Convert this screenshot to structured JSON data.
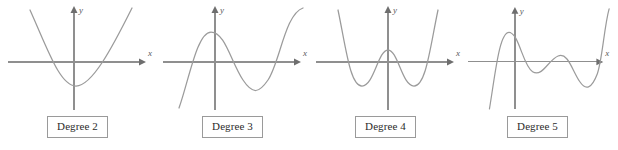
{
  "figure": {
    "background_color": "#ffffff",
    "axis_color": "#8f8f8f",
    "curve_color": "#9b9b9b",
    "label_border_color": "#9a9a9a",
    "label_text_color": "#2b2b2b"
  },
  "axis_labels": {
    "x": "x",
    "y": "y"
  },
  "panels": [
    {
      "id": "degree-2",
      "label": "Degree 2",
      "x_axis_label": "x",
      "y_axis_label": "y",
      "curve_path": "M 30 10 C 48 50, 60 86, 76 86 C 92 86, 112 48, 132 8",
      "y_axis": {
        "x": 74,
        "top": 9,
        "bottom": 110
      },
      "x_axis": {
        "y": 62,
        "left": 8,
        "right": 142
      }
    },
    {
      "id": "degree-3",
      "label": "Degree 3",
      "x_axis_label": "x",
      "y_axis_label": "y",
      "curve_path": "M 24 108 C 34 80, 42 32, 56 32 C 70 32, 76 62, 88 80 C 98 95, 104 93, 113 80 C 125 62, 130 14, 148 8",
      "y_axis": {
        "x": 60,
        "top": 9,
        "bottom": 110
      },
      "x_axis": {
        "y": 62,
        "left": 8,
        "right": 142
      }
    },
    {
      "id": "degree-4",
      "label": "Degree 4",
      "x_axis_label": "x",
      "y_axis_label": "y",
      "curve_path": "M 30 10 C 38 48, 42 86, 54 86 C 66 86, 70 50, 80 50 C 90 50, 94 86, 106 86 C 118 86, 122 48, 130 10",
      "y_axis": {
        "x": 80,
        "top": 9,
        "bottom": 110
      },
      "x_axis": {
        "y": 62,
        "left": 8,
        "right": 142
      }
    },
    {
      "id": "degree-5",
      "label": "Degree 5",
      "x_axis_label": "x",
      "y_axis_label": "y",
      "curve_path": "M 30 110 C 36 74, 40 32, 50 32 C 60 32, 64 66, 74 72 C 84 78, 90 60, 100 56 C 110 52, 114 70, 122 82 C 128 91, 134 90, 140 74 C 145 60, 147 26, 152 8",
      "y_axis": {
        "x": 56,
        "top": 9,
        "bottom": 110
      },
      "x_axis": {
        "y": 62,
        "left": 8,
        "right": 142
      }
    }
  ],
  "chart_data": {
    "type": "line",
    "title": "",
    "xlabel": "x",
    "ylabel": "y",
    "grid": false,
    "legend": "none",
    "series": [
      {
        "name": "Degree 2",
        "shape": "upward parabola",
        "turning_points": 1,
        "x_intercepts": 2,
        "end_behavior": "up on left, up on right"
      },
      {
        "name": "Degree 3",
        "shape": "cubic with local max then local min",
        "turning_points": 2,
        "x_intercepts": 3,
        "end_behavior": "down on left, up on right"
      },
      {
        "name": "Degree 4",
        "shape": "W-shaped quartic with two local minima and one local maximum",
        "turning_points": 3,
        "x_intercepts": 4,
        "end_behavior": "up on left, up on right"
      },
      {
        "name": "Degree 5",
        "shape": "quintic with two local maxima and two local minima",
        "turning_points": 4,
        "x_intercepts": 5,
        "end_behavior": "down on left, up on right"
      }
    ]
  }
}
